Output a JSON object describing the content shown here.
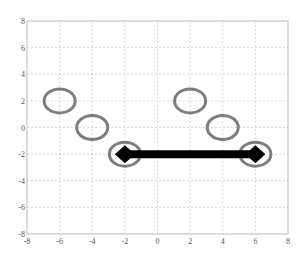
{
  "chart_data": {
    "type": "scatter",
    "title": "",
    "xlabel": "",
    "ylabel": "",
    "xlim": [
      -8,
      8
    ],
    "ylim": [
      -8,
      8
    ],
    "grid": true,
    "xticks": [
      -8,
      -6,
      -4,
      -2,
      0,
      2,
      4,
      6,
      8
    ],
    "yticks": [
      -8,
      -6,
      -4,
      -2,
      0,
      2,
      4,
      6,
      8
    ],
    "series": [
      {
        "name": "circles",
        "marker": "open-ellipse",
        "color": "#666666",
        "points": [
          [
            -6,
            2
          ],
          [
            -4,
            0
          ],
          [
            -2,
            -2
          ],
          [
            2,
            2
          ],
          [
            4,
            0
          ],
          [
            6,
            -2
          ]
        ]
      },
      {
        "name": "segment",
        "marker": "diamond",
        "line_width": "thick",
        "color": "#000000",
        "points": [
          [
            -2,
            -2
          ],
          [
            6,
            -2
          ]
        ]
      }
    ],
    "legend": null
  },
  "colors": {
    "grid": "#cfcfcf",
    "axis": "#bbbbbb",
    "circle": "#666666",
    "segment": "#000000"
  }
}
